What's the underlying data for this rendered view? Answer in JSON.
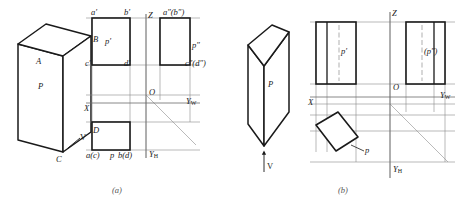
{
  "figure": {
    "title_domain": "orthographic-projection-drawing",
    "captions": [
      {
        "id": "caption-a",
        "text": "(a)",
        "x": 112,
        "y": 186
      },
      {
        "id": "caption-b",
        "text": "(b)",
        "x": 338,
        "y": 186
      }
    ],
    "colors": {
      "ink": "#1a1a1a",
      "thin_line": "#8c8c8c",
      "dash_line": "#8c8c8c",
      "caption": "#555555",
      "background": "#ffffff"
    },
    "panel_a": {
      "name": "figure-a",
      "solid": {
        "name": "solid-a",
        "face_label": "P",
        "vertex_labels": [
          "A",
          "B",
          "C",
          "D"
        ],
        "direction_label": "V"
      },
      "axes": {
        "X": "X",
        "O": "O",
        "Z": "Z",
        "Yw": "Y",
        "Yw_sub": "W",
        "Yh": "Y",
        "Yh_sub": "H"
      },
      "projection_labels": {
        "front_top_left": "a′",
        "front_top_right": "b′",
        "front_bottom_left": "c′",
        "front_bottom_right": "d′",
        "front_face": "p′",
        "side_top": "a″(b″)",
        "side_bottom": "c″(d″)",
        "side_face": "p″",
        "top_left": "a(c)",
        "top_face": "p",
        "top_right": "b(d)"
      }
    },
    "panel_b": {
      "name": "figure-b",
      "solid": {
        "name": "solid-b",
        "face_label": "P",
        "direction_label": "V"
      },
      "axes": {
        "X": "X",
        "O": "O",
        "Z": "Z",
        "Yw": "Y",
        "Yw_sub": "W",
        "Yh": "Y",
        "Yh_sub": "H"
      },
      "projection_labels": {
        "front_face": "p′",
        "side_face": "(p″)",
        "top_face": "p"
      }
    }
  }
}
